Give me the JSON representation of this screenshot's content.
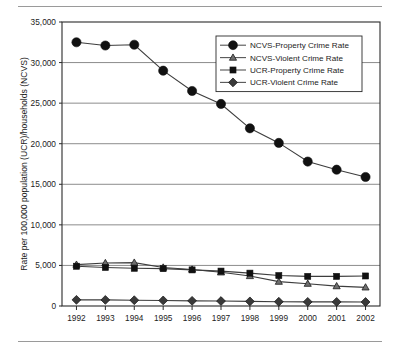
{
  "chart_data": {
    "type": "line",
    "title": "",
    "xlabel": "",
    "ylabel": "Rate per 100,000 population (UCR)/households (NCVS)",
    "categories": [
      "1992",
      "1993",
      "1994",
      "1995",
      "1996",
      "1997",
      "1998",
      "1999",
      "2000",
      "2001",
      "2002"
    ],
    "x": [
      1992,
      1993,
      1994,
      1995,
      1996,
      1997,
      1998,
      1999,
      2000,
      2001,
      2002
    ],
    "ylim": [
      0,
      35000
    ],
    "yticks": [
      0,
      5000,
      10000,
      15000,
      20000,
      25000,
      30000,
      35000
    ],
    "ytick_labels": [
      "0",
      "5,000",
      "10,000",
      "15,000",
      "20,000",
      "25,000",
      "30,000",
      "35,000"
    ],
    "grid": true,
    "legend_position": "top-right",
    "series": [
      {
        "name": "NCVS-Property Crime Rate",
        "marker": "circle",
        "values": [
          32500,
          32100,
          32200,
          29000,
          26500,
          24900,
          21900,
          20100,
          17800,
          16800,
          15900
        ]
      },
      {
        "name": "NCVS-Violent Crime Rate",
        "marker": "triangle",
        "values": [
          5100,
          5300,
          5350,
          4750,
          4500,
          4150,
          3700,
          3000,
          2750,
          2450,
          2300
        ]
      },
      {
        "name": "UCR-Property Crime Rate",
        "marker": "square",
        "values": [
          4900,
          4750,
          4650,
          4600,
          4450,
          4300,
          4050,
          3750,
          3650,
          3650,
          3700
        ]
      },
      {
        "name": "UCR-Violent Crime Rate",
        "marker": "diamond",
        "values": [
          760,
          750,
          715,
          685,
          637,
          611,
          568,
          525,
          507,
          505,
          495
        ]
      }
    ]
  }
}
